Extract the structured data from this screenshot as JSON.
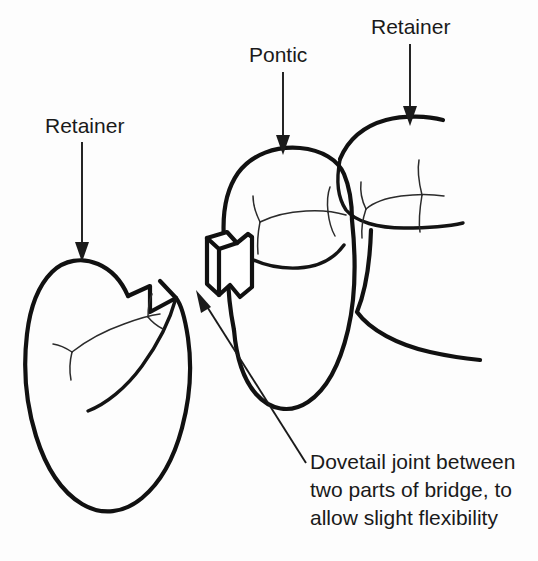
{
  "figure": {
    "background_color": "#fdfdfd",
    "ink_color": "#111111",
    "width": 538,
    "height": 561
  },
  "labels": {
    "retainer_left": "Retainer",
    "pontic": "Pontic",
    "retainer_right": "Retainer"
  },
  "caption": {
    "line1": "Dovetail joint between",
    "line2": "two parts of bridge, to",
    "line3": "allow slight flexibility"
  },
  "parts": {
    "left_retainer_tooth": "left-retainer-tooth",
    "pontic_tooth": "pontic-tooth",
    "right_retainer_tooth": "right-retainer-tooth",
    "dovetail_tenon": "dovetail-tenon",
    "dovetail_socket": "dovetail-socket"
  },
  "leaders": {
    "retainer_left_arrow": "arrow-down",
    "pontic_arrow": "arrow-down",
    "retainer_right_arrow": "arrow-down",
    "dovetail_arrow": "arrow-diagonal-up-left"
  }
}
